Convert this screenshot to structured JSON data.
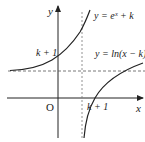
{
  "figure": {
    "axis_labels": {
      "x": "x",
      "y": "y",
      "origin": "O"
    },
    "curves": [
      {
        "name": "exponential",
        "label": "y = eˣ + k"
      },
      {
        "name": "logarithm",
        "label": "y = ln(x − k)"
      }
    ],
    "ticks": {
      "y_intercept": "k + 1",
      "x_intercept": "k + 1"
    },
    "asymptotes": {
      "horizontal": "y = k",
      "vertical": "x = k"
    },
    "colors": {
      "curve": "#222222",
      "axis": "#222222",
      "dashed": "#555555"
    }
  }
}
